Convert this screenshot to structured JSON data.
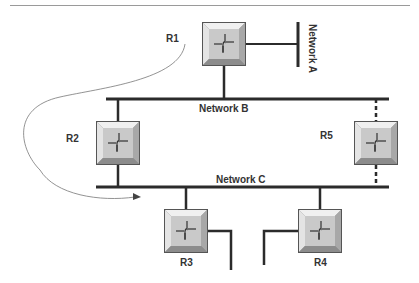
{
  "diagram": {
    "type": "network-topology",
    "colors": {
      "line": "#2b2b2b",
      "rule": "#9a9a9a",
      "router_face": "#c8c8c8",
      "router_bevel_light": "#eeeeee",
      "router_bevel_dark": "#8a8a8a",
      "arrow": "#666666"
    },
    "networks": [
      {
        "id": "A",
        "label": "Network A",
        "orientation": "vertical"
      },
      {
        "id": "B",
        "label": "Network B",
        "orientation": "horizontal"
      },
      {
        "id": "C",
        "label": "Network C",
        "orientation": "horizontal"
      }
    ],
    "routers": [
      {
        "id": "R1",
        "label": "R1",
        "connects": [
          "Network A",
          "Network B"
        ]
      },
      {
        "id": "R2",
        "label": "R2",
        "connects": [
          "Network B",
          "Network C"
        ]
      },
      {
        "id": "R3",
        "label": "R3",
        "connects": [
          "Network C",
          "external"
        ]
      },
      {
        "id": "R4",
        "label": "R4",
        "connects": [
          "Network C",
          "external"
        ]
      },
      {
        "id": "R5",
        "label": "R5",
        "connects": [
          "Network B",
          "Network C"
        ],
        "link_style": "dashed"
      }
    ],
    "path_arrow": {
      "from": "R1",
      "to": "Network C",
      "description": "curved arrow from R1 label to Network C"
    }
  }
}
